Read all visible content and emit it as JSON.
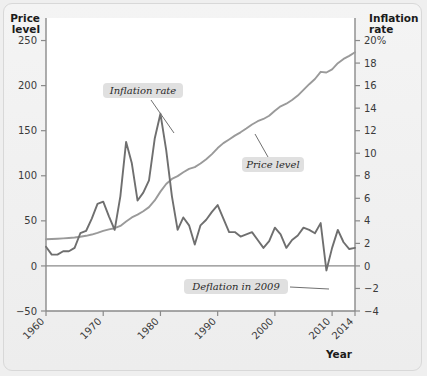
{
  "figure": {
    "left_axis_title_line1": "Price",
    "left_axis_title_line2": "level",
    "right_axis_title_line1": "Inflation",
    "right_axis_title_line2": "rate",
    "x_axis_title": "Year",
    "annotations": [
      {
        "name": "inflation-rate-callout",
        "text": "Inflation rate"
      },
      {
        "name": "price-level-callout",
        "text": "Price level"
      },
      {
        "name": "deflation-callout",
        "text": "Deflation in 2009"
      }
    ],
    "colors": {
      "inflation_line": "#6f6f6f",
      "price_line": "#9a9a9a",
      "axis": "#8a8a8a",
      "zero_line": "#8a8a8a",
      "callout_bg": "#e0e0e0",
      "page_bg": "#efefef"
    }
  },
  "chart_data": {
    "type": "line",
    "title": "",
    "subtitle": "",
    "xlabel": "Year",
    "grid": false,
    "legend": "none (inline callout labels)",
    "x": [
      1960,
      1961,
      1962,
      1963,
      1964,
      1965,
      1966,
      1967,
      1968,
      1969,
      1970,
      1971,
      1972,
      1973,
      1974,
      1975,
      1976,
      1977,
      1978,
      1979,
      1980,
      1981,
      1982,
      1983,
      1984,
      1985,
      1986,
      1987,
      1988,
      1989,
      1990,
      1991,
      1992,
      1993,
      1994,
      1995,
      1996,
      1997,
      1998,
      1999,
      2000,
      2001,
      2002,
      2003,
      2004,
      2005,
      2006,
      2007,
      2008,
      2009,
      2010,
      2011,
      2012,
      2013,
      2014
    ],
    "xlim": [
      1960,
      2014
    ],
    "xticks": [
      1960,
      1970,
      1980,
      1990,
      2000,
      2010,
      2014
    ],
    "xtick_labels": [
      "1960",
      "1970",
      "1980",
      "1990",
      "2000",
      "2010",
      "2014"
    ],
    "axes": [
      {
        "name": "left",
        "label_line1": "Price",
        "label_line2": "level",
        "ylim": [
          -50,
          275
        ],
        "yticks": [
          -50,
          0,
          50,
          100,
          150,
          200,
          250
        ],
        "ytick_labels": [
          "−50",
          "0",
          "50",
          "100",
          "150",
          "200",
          "250"
        ]
      },
      {
        "name": "right",
        "label_line1": "Inflation",
        "label_line2": "rate",
        "ylim": [
          -4,
          22
        ],
        "yticks": [
          -4,
          -2,
          0,
          2,
          4,
          6,
          8,
          10,
          12,
          14,
          16,
          18,
          20
        ],
        "ytick_labels": [
          "−4",
          "−2",
          "0",
          "2",
          "4",
          "6",
          "8",
          "10",
          "12",
          "14",
          "16",
          "18",
          "20%"
        ]
      }
    ],
    "series": [
      {
        "name": "Price level",
        "axis": "left",
        "unit": "index",
        "color": "#9a9a9a",
        "values": [
          29.6,
          29.9,
          30.2,
          30.6,
          31.0,
          31.5,
          32.4,
          33.4,
          34.8,
          36.7,
          38.8,
          40.5,
          41.8,
          44.4,
          49.3,
          53.8,
          56.9,
          60.6,
          65.2,
          72.6,
          82.4,
          90.9,
          96.5,
          99.6,
          103.9,
          107.6,
          109.6,
          113.6,
          118.3,
          124.0,
          130.7,
          136.2,
          140.3,
          144.5,
          148.2,
          152.4,
          156.9,
          160.5,
          163.0,
          166.6,
          172.2,
          177.1,
          179.9,
          184.0,
          188.9,
          195.3,
          201.6,
          207.3,
          215.3,
          214.5,
          218.1,
          224.9,
          229.6,
          233.0,
          237.0
        ]
      },
      {
        "name": "Inflation rate",
        "axis": "right",
        "unit": "percent",
        "color": "#6f6f6f",
        "values": [
          1.7,
          1.0,
          1.0,
          1.3,
          1.3,
          1.6,
          2.9,
          3.1,
          4.2,
          5.5,
          5.7,
          4.4,
          3.2,
          6.2,
          11.0,
          9.1,
          5.8,
          6.5,
          7.6,
          11.3,
          13.5,
          10.3,
          6.2,
          3.2,
          4.3,
          3.6,
          1.9,
          3.6,
          4.1,
          4.8,
          5.4,
          4.2,
          3.0,
          3.0,
          2.6,
          2.8,
          3.0,
          2.3,
          1.6,
          2.2,
          3.4,
          2.8,
          1.6,
          2.3,
          2.7,
          3.4,
          3.2,
          2.9,
          3.8,
          -0.4,
          1.6,
          3.2,
          2.1,
          1.5,
          1.6
        ]
      }
    ],
    "annotations": [
      {
        "text": "Inflation rate",
        "points_to_year": 1980,
        "points_to_value": 13.5,
        "axis": "right"
      },
      {
        "text": "Price level",
        "points_to_year": 1993,
        "points_to_value": 144.5,
        "axis": "left"
      },
      {
        "text": "Deflation in 2009",
        "points_to_year": 2009,
        "points_to_value": -0.4,
        "axis": "right"
      }
    ]
  }
}
